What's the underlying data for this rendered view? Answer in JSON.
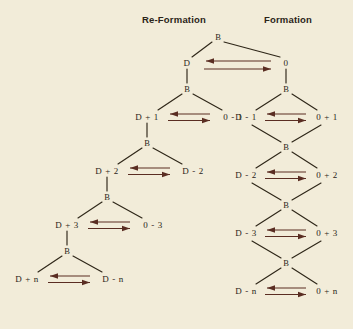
{
  "figure": {
    "background_color": "#f2ecd9",
    "ink_color": "#2b2418",
    "arrow_color": "#5a2d22"
  },
  "headers": {
    "left": "Re-Formation",
    "right": "Formation"
  },
  "branch_node_label": "B",
  "root": {
    "label": "B",
    "left_child": "D",
    "right_child": "0"
  },
  "left_tree": {
    "name": "Re-Formation",
    "top_node": "D",
    "rows": [
      {
        "branch": "B",
        "left": "D + 1",
        "right": "0 - 1"
      },
      {
        "branch": "B",
        "left": "D + 2",
        "right": "D - 2"
      },
      {
        "branch": "B",
        "left": "D + 3",
        "right": "0 - 3"
      },
      {
        "branch": "B",
        "left": "D + n",
        "right": "D - n"
      }
    ]
  },
  "right_tree": {
    "name": "Formation",
    "top_node": "0",
    "rows": [
      {
        "branch": "B",
        "left": "D - 1",
        "right": "0 + 1"
      },
      {
        "branch": "B",
        "left": "D - 2",
        "right": "0 + 2"
      },
      {
        "branch": "B",
        "left": "D - 3",
        "right": "0 + 3"
      },
      {
        "branch": "B",
        "left": "D - n",
        "right": "0 + n"
      }
    ]
  }
}
